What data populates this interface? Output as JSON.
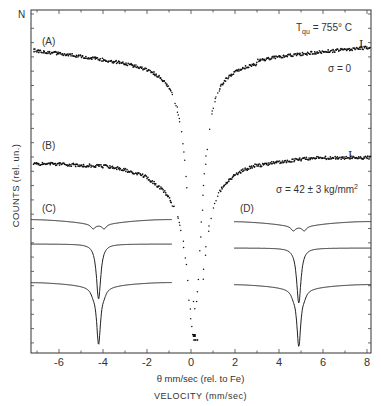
{
  "chart_data": {
    "type": "scatter",
    "title": "",
    "xlabel": "θ mm/sec (rel. to Fe)",
    "xlabel_secondary": "VELOCITY (mm/sec)",
    "ylabel": "COUNTS (rel. un.)",
    "y_top_marker": "N",
    "xlim": [
      -7.2,
      8.2
    ],
    "x_ticks": [
      -6,
      -4,
      -2,
      0,
      2,
      4,
      6,
      8
    ],
    "grid": false,
    "annotations": {
      "temperature": "T_qu = 755° C",
      "error_bar_symbol": "I",
      "sigma_A": "σ = 0",
      "sigma_B": "σ = 42 ± 3 kg/mm²"
    },
    "series": [
      {
        "name": "(A)",
        "kind": "measured points",
        "sigma": "0",
        "baseline_left": 0.93,
        "baseline_right": 0.94,
        "min_velocity": 0.2,
        "points": [
          [
            -7.2,
            0.93
          ],
          [
            -6,
            0.93
          ],
          [
            -5,
            0.92
          ],
          [
            -4,
            0.91
          ],
          [
            -3,
            0.9
          ],
          [
            -2,
            0.89
          ],
          [
            -1,
            0.87
          ],
          [
            -0.6,
            0.8
          ],
          [
            -0.4,
            0.7
          ],
          [
            -0.2,
            0.55
          ],
          [
            0,
            0.4
          ],
          [
            0.2,
            0.34
          ],
          [
            0.4,
            0.4
          ],
          [
            0.6,
            0.55
          ],
          [
            0.8,
            0.7
          ],
          [
            1,
            0.82
          ],
          [
            1.3,
            0.88
          ],
          [
            2,
            0.89
          ],
          [
            3,
            0.9
          ],
          [
            4,
            0.91
          ],
          [
            5,
            0.92
          ],
          [
            6,
            0.93
          ],
          [
            7,
            0.93
          ],
          [
            8.2,
            0.93
          ]
        ]
      },
      {
        "name": "(B)",
        "kind": "measured points",
        "sigma": "42 ± 3 kg/mm²",
        "min_velocity": 0.2,
        "points": [
          [
            -7.2,
            0.7
          ],
          [
            -6,
            0.7
          ],
          [
            -5,
            0.69
          ],
          [
            -4,
            0.66
          ],
          [
            -3,
            0.65
          ],
          [
            -2,
            0.61
          ],
          [
            -1,
            0.58
          ],
          [
            -0.6,
            0.5
          ],
          [
            -0.4,
            0.4
          ],
          [
            -0.2,
            0.25
          ],
          [
            0,
            0.08
          ],
          [
            0.2,
            0.02
          ],
          [
            0.4,
            0.1
          ],
          [
            0.6,
            0.3
          ],
          [
            0.8,
            0.45
          ],
          [
            1,
            0.52
          ],
          [
            2,
            0.58
          ],
          [
            3,
            0.62
          ],
          [
            4,
            0.66
          ],
          [
            5,
            0.68
          ],
          [
            6,
            0.69
          ],
          [
            7,
            0.69
          ],
          [
            8.2,
            0.69
          ]
        ]
      },
      {
        "name": "(C)",
        "kind": "fitted subspectra (inset, left line)",
        "center_velocity": -4.2,
        "curves": [
          "broad weak doublet",
          "single sharp line",
          "sum (sharp + broad)"
        ]
      },
      {
        "name": "(D)",
        "kind": "fitted subspectra (inset, right line)",
        "center_velocity": 4.9,
        "curves": [
          "broad weak doublet",
          "single sharp line",
          "sum (sharp + broad)"
        ]
      }
    ],
    "panel_labels": [
      "(A)",
      "(B)",
      "(C)",
      "(D)"
    ]
  }
}
